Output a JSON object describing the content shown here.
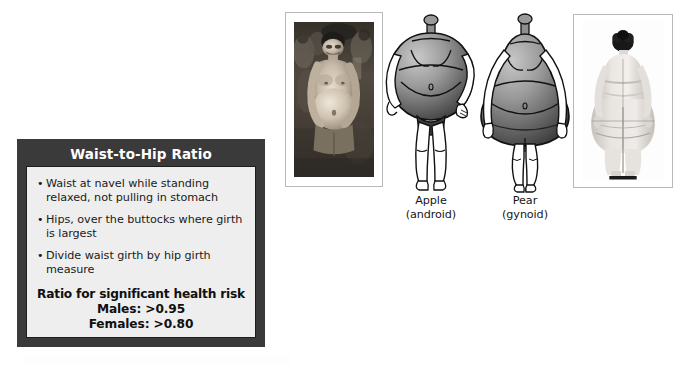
{
  "card": {
    "title": "Waist-to-Hip Ratio",
    "bullets": [
      "Waist at navel while standing relaxed, not pulling in stomach",
      "Hips, over the buttocks where girth is largest",
      "Divide waist girth by hip girth measure"
    ],
    "bullet_glyph": "•",
    "ratio_heading": "Ratio for significant health risk",
    "ratio_lines": [
      "Males: >0.95",
      "Females: >0.80"
    ],
    "colors": {
      "frame": "#3a3a3a",
      "panel": "#eeeeee",
      "title_text": "#ffffff",
      "body_text": "#1a1a1a"
    }
  },
  "figures": {
    "photo_left": {
      "alt": "photograph of a man with abdominal (apple-shaped) obesity"
    },
    "photo_right": {
      "alt": "photograph of rear view of a woman with gluteofemoral (pear-shaped) obesity"
    },
    "apple": {
      "name": "Apple",
      "subtitle": "(android)"
    },
    "pear": {
      "name": "Pear",
      "subtitle": "(gynoid)"
    },
    "colors": {
      "body_light": "#c2c2c2",
      "body_mid": "#8d8d8d",
      "body_dark": "#4d4d4d",
      "outline": "#111111",
      "limb_fill": "#ffffff"
    }
  }
}
